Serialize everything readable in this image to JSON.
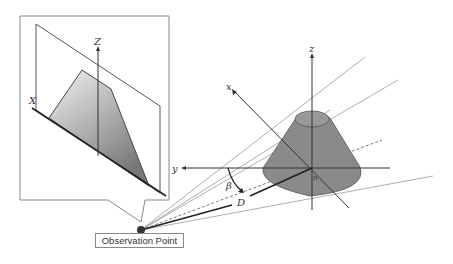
{
  "diagram": {
    "observation_point_label": "Observation Point",
    "inset_labels": {
      "x_axis": "X",
      "z_axis": "Z"
    },
    "main_labels": {
      "x_axis": "x",
      "y_axis": "y",
      "z_axis": "z",
      "origin": "n",
      "angle": "β",
      "distance": "D"
    },
    "colors": {
      "cone_fill": "#8a8a8a",
      "cone_stroke": "#555555",
      "line": "#333333",
      "ray": "#999999",
      "observer_dot": "#333333"
    }
  }
}
